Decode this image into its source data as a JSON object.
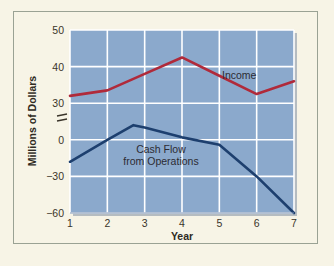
{
  "figure": {
    "background_color": "#f7f4e6",
    "border_color": "#9aa294",
    "plot_background_color": "#8ba9cc",
    "grid_color": "#ffffff",
    "shadow_color": "#7b8ea8"
  },
  "chart_data": {
    "type": "line",
    "title": "",
    "xlabel": "Year",
    "ylabel": "Millions of Dollars",
    "x": [
      1,
      2,
      3,
      4,
      5,
      6,
      7
    ],
    "xticklabels": [
      "1",
      "2",
      "3",
      "4",
      "5",
      "6",
      "7"
    ],
    "xlim": [
      1,
      7
    ],
    "yticklabels": [
      "50",
      "40",
      "30",
      "0",
      "-30",
      "-60"
    ],
    "ytickvalues": [
      50,
      40,
      30,
      0,
      -30,
      -60
    ],
    "axis_break": {
      "symbol": "=",
      "between": [
        30,
        0
      ],
      "note": "broken y-axis"
    },
    "grid": true,
    "legend_position": "inline-labels",
    "series": [
      {
        "name": "Income",
        "color": "#b02a3a",
        "label_text": "Income",
        "x": [
          1,
          2,
          3,
          4,
          5,
          6,
          7
        ],
        "values": [
          32,
          33.5,
          38,
          42.5,
          37.5,
          32.5,
          36
        ]
      },
      {
        "name": "Cash Flow from Operations",
        "color": "#1d3f6e",
        "label_text": "Cash Flow\nfrom Operations",
        "label_line1": "Cash Flow",
        "label_line2": "from Operations",
        "x": [
          1,
          2,
          2.7,
          3,
          4,
          5,
          6,
          7
        ],
        "values": [
          -18,
          0,
          12,
          10,
          2,
          -4,
          -30,
          -60
        ]
      }
    ]
  }
}
